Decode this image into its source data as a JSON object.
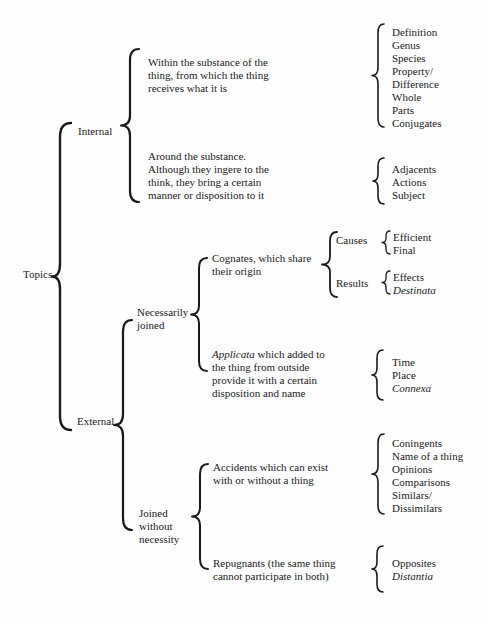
{
  "style": {
    "ink": "#1a1a1a",
    "paper": "#fefefe"
  },
  "diagram": {
    "root": {
      "label": "Topics"
    },
    "internal": {
      "label": "Internal",
      "within_substance": {
        "description_lines": [
          "Within the substance of the",
          "thing, from which the thing",
          "receives what it is"
        ],
        "topics": [
          "Definition",
          "Genus",
          "Species",
          "Property/",
          "Difference",
          "Whole",
          "Parts",
          "Conjugates"
        ]
      },
      "around_substance": {
        "description_lines": [
          "Around the substance.",
          "Although they ingere to the",
          "think, they bring a certain",
          "manner or disposition to it"
        ],
        "topics": [
          "Adjacents",
          "Actions",
          "Subject"
        ]
      }
    },
    "external": {
      "label": "External",
      "necessarily_joined": {
        "label_lines": [
          "Necessarily",
          "joined"
        ],
        "cognates": {
          "description_lines": [
            "Cognates, which share",
            "their origin"
          ],
          "causes": {
            "label": "Causes",
            "topics": [
              "Efficient",
              "Final"
            ]
          },
          "results": {
            "label": "Results",
            "topics": [
              "Effects",
              [
                {
                  "t": "Destinata",
                  "i": true
                }
              ]
            ]
          }
        },
        "applicata": {
          "description_lines": [
            [
              {
                "t": "Applicata",
                "i": true
              },
              {
                "t": " which added to"
              }
            ],
            "the thing from outside",
            "provide it with a certain",
            "disposition and name"
          ],
          "topics": [
            "Time",
            "Place",
            [
              {
                "t": "Connexa",
                "i": true
              }
            ]
          ]
        }
      },
      "joined_without_necessity": {
        "label_lines": [
          "Joined",
          "without",
          "necessity"
        ],
        "accidents": {
          "description_lines": [
            "Accidents which can exist",
            "with or without a thing"
          ],
          "topics": [
            "Coningents",
            "Name of a thing",
            "Opinions",
            "Comparisons",
            "Similars/",
            "Dissimilars"
          ]
        },
        "repugnants": {
          "description_lines": [
            "Repugnants (the same thing",
            "cannot participate in both)"
          ],
          "topics": [
            "Opposites",
            [
              {
                "t": "Distantia",
                "i": true
              }
            ]
          ]
        }
      }
    }
  }
}
